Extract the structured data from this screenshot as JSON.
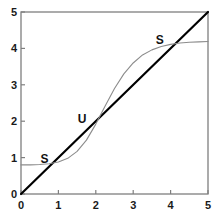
{
  "chart_data": {
    "type": "line",
    "title": "",
    "xlabel": "",
    "ylabel": "",
    "xlim": [
      0,
      5
    ],
    "ylim": [
      0,
      5
    ],
    "grid": false,
    "legend": null,
    "xticks": [
      "0",
      "1",
      "2",
      "3",
      "4",
      "5"
    ],
    "yticks": [
      "0",
      "1",
      "2",
      "3",
      "4",
      "5"
    ],
    "xtick_values": [
      0,
      1,
      2,
      3,
      4,
      5
    ],
    "ytick_values": [
      0,
      1,
      2,
      3,
      4,
      5
    ],
    "series": [
      {
        "name": "identity line",
        "type": "line",
        "color": "#000000",
        "width": 2.2,
        "x": [
          0,
          5
        ],
        "values": [
          0,
          5
        ]
      },
      {
        "name": "sigmoid map",
        "type": "line",
        "color": "#8c8c8c",
        "width": 1.1,
        "x": [
          0.0,
          0.25,
          0.5,
          0.75,
          1.0,
          1.25,
          1.5,
          1.75,
          2.0,
          2.25,
          2.5,
          2.75,
          3.0,
          3.25,
          3.5,
          3.75,
          4.0,
          4.25,
          4.5,
          4.75,
          5.0
        ],
        "values": [
          0.8,
          0.8,
          0.81,
          0.83,
          0.88,
          0.98,
          1.17,
          1.48,
          1.92,
          2.42,
          2.9,
          3.3,
          3.6,
          3.82,
          3.96,
          4.05,
          4.11,
          4.15,
          4.17,
          4.18,
          4.19
        ]
      }
    ],
    "annotations": [
      {
        "text": "S",
        "x": 0.52,
        "y": 0.97,
        "point_x": 0.85,
        "point_y": 0.85,
        "kind": "stable-fixed-point"
      },
      {
        "text": "U",
        "x": 1.52,
        "y": 2.05,
        "point_x": 1.91,
        "point_y": 1.91,
        "kind": "unstable-fixed-point"
      },
      {
        "text": "S",
        "x": 3.6,
        "y": 4.22,
        "point_x": 4.05,
        "point_y": 4.05,
        "kind": "stable-fixed-point"
      }
    ]
  },
  "axes": {
    "frame_color": "#7f7f7f",
    "tick_color": "#7f7f7f",
    "x_labels": [
      "0",
      "1",
      "2",
      "3",
      "4",
      "5"
    ],
    "y_labels": [
      "0",
      "1",
      "2",
      "3",
      "4",
      "5"
    ]
  },
  "annotation_labels": [
    "S",
    "U",
    "S"
  ]
}
